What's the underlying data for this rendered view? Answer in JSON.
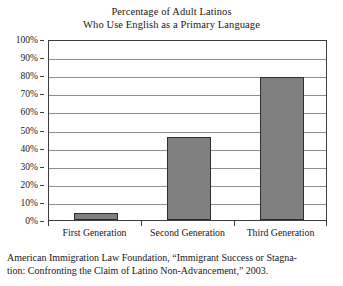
{
  "chart_data": {
    "type": "bar",
    "title": "Percentage of Adult Latinos Who Use English as a Primary Language",
    "title_lines": [
      "Percentage of Adult Latinos",
      "Who Use English as a Primary Language"
    ],
    "xlabel": "",
    "ylabel": "",
    "categories": [
      "First Generation",
      "Second Generation",
      "Third Generation"
    ],
    "values": [
      4,
      46,
      79
    ],
    "ylim": [
      0,
      100
    ],
    "y_ticks": [
      0,
      10,
      20,
      30,
      40,
      50,
      60,
      70,
      80,
      90,
      100
    ],
    "y_tick_labels": [
      "0%",
      "10%",
      "20%",
      "30%",
      "40%",
      "50%",
      "60%",
      "70%",
      "80%",
      "90%",
      "100%"
    ],
    "grid": true,
    "legend": false,
    "bar_color": "#808080",
    "bar_border_color": "#2f2f2f",
    "gridline_color": "#8e8e8e",
    "axis_color": "#3d3d3d",
    "background_color": "#ffffff"
  },
  "source": {
    "lines": [
      "American Immigration Law Foundation, “Immigrant Success or Stagna-",
      "tion: Confronting the Claim of Latino Non-Advancement,” 2003."
    ],
    "full_text": "American Immigration Law Foundation, “Immigrant Success or Stagnation: Confronting the Claim of Latino Non-Advancement,” 2003."
  }
}
